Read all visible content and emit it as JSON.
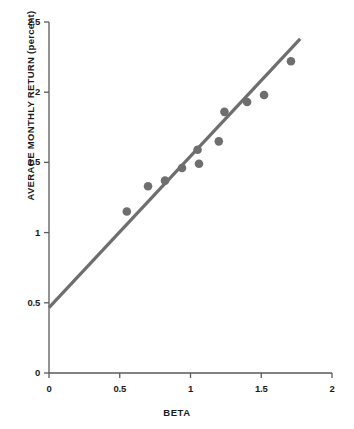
{
  "chart_data": {
    "type": "scatter",
    "title": "",
    "xlabel": "BETA",
    "ylabel": "AVERAGE MONTHLY RETURN (percent)",
    "xlim": [
      0,
      2
    ],
    "ylim": [
      0,
      2.5
    ],
    "xticks": [
      "0",
      "0.5",
      "1",
      "1.5",
      "2"
    ],
    "xtick_values": [
      0,
      0.5,
      1,
      1.5,
      2
    ],
    "yticks": [
      "0",
      "0.5",
      "1",
      "1.5",
      "2",
      "2.5"
    ],
    "ytick_values": [
      0,
      0.5,
      1,
      1.5,
      2,
      2.5
    ],
    "grid": false,
    "legend": "none",
    "marker_color": "#6e6e6e",
    "line_color": "#6e6e6e",
    "axis_color": "#5a5a5a",
    "text_color": "#1a1a1a",
    "background": "#ffffff",
    "points": [
      {
        "x": 0.55,
        "y": 1.15
      },
      {
        "x": 0.7,
        "y": 1.33
      },
      {
        "x": 0.82,
        "y": 1.37
      },
      {
        "x": 0.94,
        "y": 1.46
      },
      {
        "x": 1.05,
        "y": 1.59
      },
      {
        "x": 1.06,
        "y": 1.49
      },
      {
        "x": 1.2,
        "y": 1.65
      },
      {
        "x": 1.24,
        "y": 1.86
      },
      {
        "x": 1.4,
        "y": 1.93
      },
      {
        "x": 1.52,
        "y": 1.98
      },
      {
        "x": 1.71,
        "y": 2.22
      }
    ],
    "fit_line": {
      "name": "security market line",
      "x0": 0.0,
      "y0": 0.465,
      "x1": 1.775,
      "y1": 2.38
    }
  },
  "axis_titles": {
    "x": "BETA",
    "y": "AVERAGE MONTHLY RETURN (percent)"
  }
}
